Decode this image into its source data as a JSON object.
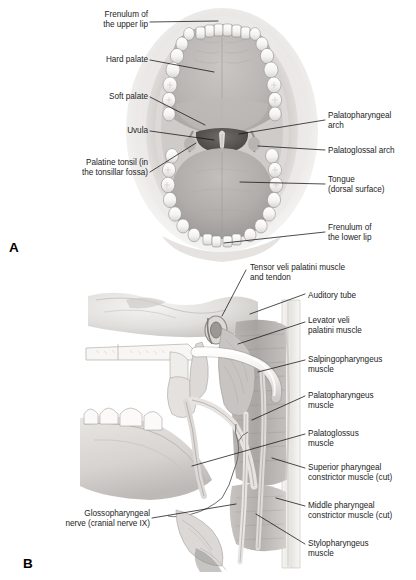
{
  "figure": {
    "background_color": "#ffffff",
    "label_color": "#1d1d1d",
    "leader_line_color": "#111111"
  },
  "panels": [
    {
      "letter": "A",
      "name": "panel-a-oral-cavity",
      "description": "Anterior view of the open oral cavity showing palate, tongue and dental arches",
      "labels_left": [
        {
          "id": "frenulum-upper-lip",
          "text": "Frenulum of\nthe upper lip"
        },
        {
          "id": "hard-palate",
          "text": "Hard palate"
        },
        {
          "id": "soft-palate",
          "text": "Soft palate"
        },
        {
          "id": "uvula",
          "text": "Uvula"
        },
        {
          "id": "palatine-tonsil",
          "text": "Palatine tonsil (in\nthe tonsillar fossa)"
        }
      ],
      "labels_right": [
        {
          "id": "palatopharyngeal-arch",
          "text": "Palatopharyngeal\narch"
        },
        {
          "id": "palatoglossal-arch",
          "text": "Palatoglossal arch"
        },
        {
          "id": "tongue",
          "text": "Tongue\n(dorsal surface)"
        },
        {
          "id": "frenulum-lower-lip",
          "text": "Frenulum of\nthe lower lip"
        }
      ]
    },
    {
      "letter": "B",
      "name": "panel-b-pharyngeal-muscles",
      "description": "Sagittal dissection of the lateral pharyngeal wall showing palatal and pharyngeal muscles",
      "labels_left": [
        {
          "id": "glossopharyngeal-nerve",
          "text": "Glossopharyngeal\nnerve (cranial nerve IX)"
        }
      ],
      "labels_right": [
        {
          "id": "tensor-veli-palatini",
          "text": "Tensor veli palatini muscle\nand tendon"
        },
        {
          "id": "auditory-tube",
          "text": "Auditory tube"
        },
        {
          "id": "levator-veli-palatini",
          "text": "Levator veli\npalatini muscle"
        },
        {
          "id": "salpingopharyngeus",
          "text": "Salpingopharyngeus\nmuscle"
        },
        {
          "id": "palatopharyngeus",
          "text": "Palatopharyngeus\nmuscle"
        },
        {
          "id": "palatoglossus",
          "text": "Palatoglossus\nmuscle"
        },
        {
          "id": "superior-pharyngeal-constrictor",
          "text": "Superior pharyngeal\nconstrictor muscle (cut)"
        },
        {
          "id": "middle-pharyngeal-constrictor",
          "text": "Middle pharyngeal\nconstrictor muscle (cut)"
        },
        {
          "id": "stylopharyngeus",
          "text": "Stylopharyngeus\nmuscle"
        }
      ]
    }
  ]
}
